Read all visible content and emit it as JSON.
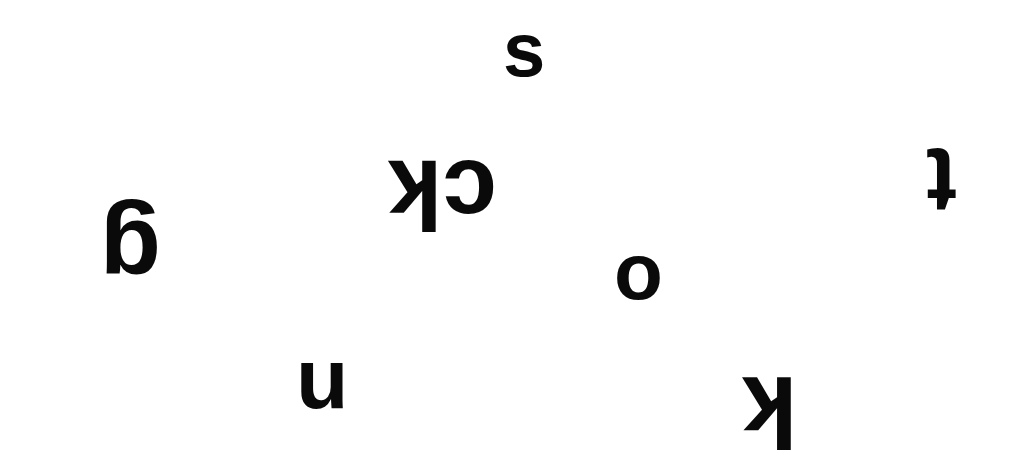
{
  "canvas": {
    "background": "#ffffff",
    "ink_color": "#0a0a0a"
  },
  "glyphs": [
    {
      "id": "s",
      "text": "s",
      "x": 503,
      "y": 10,
      "size": 76,
      "rotation": "none"
    },
    {
      "id": "ck",
      "text": "ck",
      "x": 388,
      "y": 138,
      "size": 98,
      "rotation": "rot180"
    },
    {
      "id": "t",
      "text": "t",
      "x": 928,
      "y": 140,
      "size": 92,
      "rotation": "rot180"
    },
    {
      "id": "g",
      "text": "g",
      "x": 98,
      "y": 190,
      "size": 100,
      "rotation": "rot180"
    },
    {
      "id": "o",
      "text": "o",
      "x": 612,
      "y": 234,
      "size": 80,
      "rotation": "none"
    },
    {
      "id": "n",
      "text": "n",
      "x": 296,
      "y": 346,
      "size": 86,
      "rotation": "rot180"
    },
    {
      "id": "k",
      "text": "k",
      "x": 742,
      "y": 352,
      "size": 100,
      "rotation": "rot180"
    }
  ]
}
